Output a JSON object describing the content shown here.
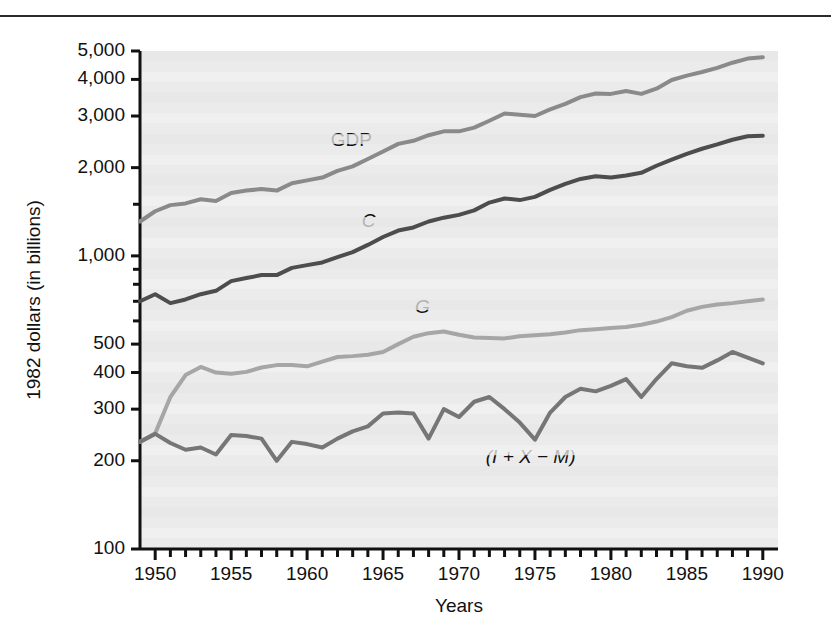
{
  "chart_data": {
    "type": "line",
    "title": "",
    "xlabel": "Years",
    "ylabel": "1982 dollars (in billions)",
    "yscale": "log",
    "ylim": [
      100,
      5000
    ],
    "xlim": [
      1949,
      1991
    ],
    "grid": false,
    "legend_position": "inline-labels",
    "y_tick_labels": [
      "5,000",
      "4,000",
      "3,000",
      "2,000",
      "1,000",
      "500",
      "400",
      "300",
      "200",
      "100"
    ],
    "y_tick_values": [
      5000,
      4000,
      3000,
      2000,
      1000,
      500,
      400,
      300,
      200,
      100
    ],
    "x_tick_labels": [
      "1950",
      "1955",
      "1960",
      "1965",
      "1970",
      "1975",
      "1980",
      "1985",
      "1990"
    ],
    "x_tick_values": [
      1950,
      1955,
      1960,
      1965,
      1970,
      1975,
      1980,
      1985,
      1990
    ],
    "x_minor_tick_interval": 1,
    "x": [
      1949,
      1950,
      1951,
      1952,
      1953,
      1954,
      1955,
      1956,
      1957,
      1958,
      1959,
      1960,
      1961,
      1962,
      1963,
      1964,
      1965,
      1966,
      1967,
      1968,
      1969,
      1970,
      1971,
      1972,
      1973,
      1974,
      1975,
      1976,
      1977,
      1978,
      1979,
      1980,
      1981,
      1982,
      1983,
      1984,
      1985,
      1986,
      1987,
      1988,
      1989,
      1990
    ],
    "series": [
      {
        "name": "GDP",
        "label": "GDP",
        "label_style": "upright",
        "color": "#8a8a8a",
        "values": [
          1310,
          1420,
          1490,
          1510,
          1560,
          1540,
          1640,
          1670,
          1690,
          1670,
          1770,
          1810,
          1850,
          1950,
          2020,
          2140,
          2270,
          2410,
          2470,
          2580,
          2660,
          2660,
          2740,
          2890,
          3060,
          3030,
          3000,
          3160,
          3300,
          3480,
          3580,
          3570,
          3650,
          3570,
          3720,
          3980,
          4120,
          4240,
          4380,
          4560,
          4710,
          4760
        ]
      },
      {
        "name": "C",
        "label": "C",
        "label_style": "italic",
        "color": "#4d4d4d",
        "values": [
          700,
          740,
          690,
          710,
          740,
          760,
          820,
          840,
          860,
          860,
          910,
          930,
          950,
          990,
          1030,
          1090,
          1160,
          1220,
          1250,
          1310,
          1350,
          1380,
          1430,
          1520,
          1570,
          1550,
          1590,
          1680,
          1760,
          1830,
          1870,
          1850,
          1880,
          1920,
          2030,
          2130,
          2230,
          2320,
          2400,
          2490,
          2560,
          2570
        ]
      },
      {
        "name": "G",
        "label": "G",
        "label_style": "italic",
        "color": "#a6a6a6",
        "values": [
          232,
          248,
          330,
          392,
          418,
          400,
          396,
          402,
          416,
          424,
          424,
          420,
          436,
          452,
          455,
          460,
          470,
          500,
          530,
          545,
          552,
          538,
          527,
          525,
          523,
          532,
          536,
          540,
          548,
          558,
          562,
          567,
          572,
          582,
          597,
          618,
          650,
          670,
          682,
          690,
          700,
          710
        ]
      },
      {
        "name": "(I + X - M)",
        "label": "(I + X − M)",
        "label_style": "italic",
        "color": "#767676",
        "values": [
          232,
          247,
          230,
          218,
          222,
          210,
          245,
          243,
          238,
          200,
          232,
          228,
          222,
          238,
          252,
          262,
          290,
          292,
          290,
          238,
          300,
          282,
          318,
          330,
          300,
          270,
          236,
          292,
          330,
          352,
          345,
          360,
          380,
          330,
          380,
          430,
          420,
          415,
          440,
          470,
          450,
          430
        ]
      }
    ],
    "inline_labels": [
      {
        "text": "GDP",
        "series": "GDP"
      },
      {
        "text": "C",
        "series": "C"
      },
      {
        "text": "G",
        "series": "G"
      },
      {
        "text": "(I + X − M)",
        "series": "(I + X - M)"
      }
    ]
  }
}
